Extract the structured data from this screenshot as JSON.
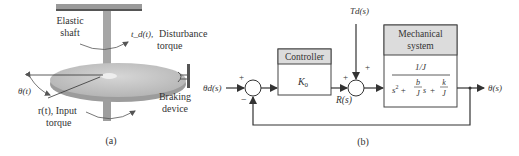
{
  "figure_a": {
    "caption": "(a)",
    "labels": {
      "elastic_shaft_line1": "Elastic",
      "elastic_shaft_line2": "shaft",
      "disturbance_symbol": "t_d(t),",
      "disturbance_line1": "Disturbance",
      "disturbance_line2": "torque",
      "theta": "θ(t)",
      "input_line1": "r(t), Input",
      "input_line2": "torque",
      "braking_line1": "Braking",
      "braking_line2": "device"
    }
  },
  "figure_b": {
    "caption": "(b)",
    "input_label": "θd(s)",
    "sum1_signs": {
      "top": "+",
      "bottom": "−"
    },
    "controller": {
      "header": "Controller",
      "gain": "K0"
    },
    "controller_output_label": "R(s)",
    "disturbance_label": "Td(s)",
    "sum2_signs": {
      "left": "+",
      "top": "+"
    },
    "plant": {
      "header_line1": "Mechanical",
      "header_line2": "system",
      "numerator": "1/J",
      "denominator": "s² + (b/J)s + k/J"
    },
    "output_label": "θ(s)"
  },
  "colors": {
    "header_fill": "#dcdcdc",
    "disk_fill": "#c4c4c4",
    "shaft_fill": "#a9a9a9",
    "line": "#333333"
  }
}
